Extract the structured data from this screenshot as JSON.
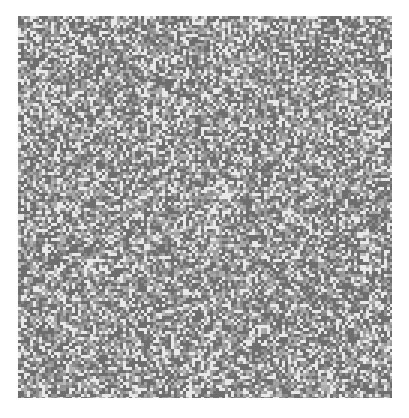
{
  "canvas": {
    "width": 409,
    "height": 418,
    "background": "#ffffff"
  },
  "texture": {
    "kind": "grayscale-noise",
    "x": 18,
    "y": 16,
    "width": 374,
    "height": 382,
    "cell_size": 3,
    "base_gray": "#9a9a9a",
    "dark_gray": "#6e6e6e",
    "light_gray": "#e8e8e8",
    "light_fraction": 0.22,
    "dark_fraction": 0.35,
    "seed": 7
  }
}
